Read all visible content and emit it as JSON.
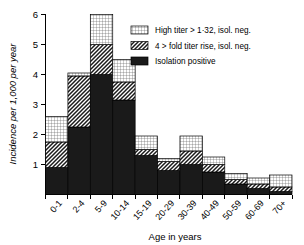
{
  "chart_data": {
    "type": "bar",
    "title": "",
    "subtitle": "",
    "xlabel": "Age in years",
    "ylabel": "Incidence per 1,000 per year",
    "ylim": [
      0,
      6
    ],
    "yticks": [
      1,
      2,
      3,
      4,
      5,
      6
    ],
    "ytick_labels": [
      "1",
      "2",
      "3",
      "4",
      "5",
      "6"
    ],
    "grid": false,
    "stacked": true,
    "legend_position": "top-right",
    "categories": [
      "0-1",
      "2-4",
      "5-9",
      "10-14",
      "15-19",
      "20-29",
      "30-39",
      "40-49",
      "50-59",
      "60-69",
      "70+"
    ],
    "series": [
      {
        "name": "Isolation positive",
        "fill": "solid-black",
        "color": "#1a1a1a",
        "values": [
          0.9,
          2.25,
          4.0,
          3.15,
          1.3,
          0.8,
          1.0,
          0.75,
          0.35,
          0.2,
          0.1
        ]
      },
      {
        "name": "4 > fold titer rise, isol. neg.",
        "fill": "diagonal-hatch",
        "color": "#ffffff",
        "values": [
          0.85,
          1.7,
          1.0,
          0.6,
          0.2,
          0.3,
          0.45,
          0.25,
          0.15,
          0.15,
          0.15
        ]
      },
      {
        "name": "High titer > 1·32, isol. neg.",
        "fill": "fine-grid",
        "color": "#ffffff",
        "values": [
          0.85,
          0.1,
          1.0,
          0.75,
          0.45,
          0.1,
          0.5,
          0.25,
          0.2,
          0.2,
          0.4
        ]
      }
    ],
    "totals": [
      2.6,
      4.05,
      6.0,
      4.5,
      1.95,
      1.2,
      1.95,
      1.25,
      0.7,
      0.55,
      0.65
    ]
  },
  "legend": {
    "entries": [
      {
        "label": "High titer > 1·32, isol. neg.",
        "swatch": "fine-grid"
      },
      {
        "label": "4 > fold titer rise, isol. neg.",
        "swatch": "diagonal-hatch"
      },
      {
        "label": "Isolation positive",
        "swatch": "solid-black"
      }
    ]
  },
  "axes": {
    "y_title": "Incidence per 1,000 per year",
    "x_title": "Age in years",
    "y_ticks": [
      "6",
      "5",
      "4",
      "3",
      "2",
      "1"
    ],
    "x_categories": [
      "0-1",
      "2-4",
      "5-9",
      "10-14",
      "15-19",
      "20-29",
      "30-39",
      "40-49",
      "50-59",
      "60-69",
      "70+"
    ]
  }
}
